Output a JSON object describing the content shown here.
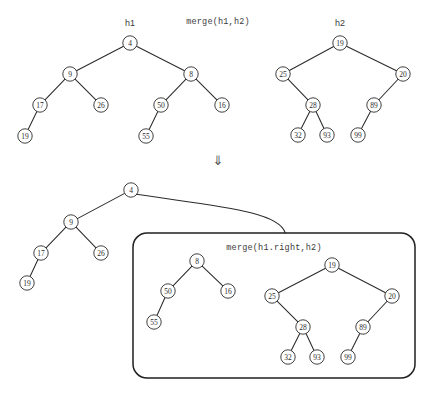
{
  "diagram": {
    "title_top_operation": "merge(h1,h2)",
    "title_box_operation": "merge(h1.right,h2)",
    "label_h1": "h1",
    "label_h2": "h2",
    "transition_arrow": "⇓",
    "colors": {
      "stroke": "#2b2b2b",
      "node_fill": "#ffffff",
      "box_stroke": "#1f1f1f",
      "text": "#3b3b3b",
      "background": "#ffffff"
    }
  },
  "top_h1_tree": {
    "name": "h1",
    "nodes": [
      {
        "id": "t1-4",
        "value": "4",
        "x": 130,
        "y": 43
      },
      {
        "id": "t1-9",
        "value": "9",
        "x": 70,
        "y": 74
      },
      {
        "id": "t1-8",
        "value": "8",
        "x": 191,
        "y": 74
      },
      {
        "id": "t1-17",
        "value": "17",
        "x": 40,
        "y": 105
      },
      {
        "id": "t1-26",
        "value": "26",
        "x": 101,
        "y": 105
      },
      {
        "id": "t1-50",
        "value": "50",
        "x": 161,
        "y": 105
      },
      {
        "id": "t1-16",
        "value": "16",
        "x": 222,
        "y": 105
      },
      {
        "id": "t1-19",
        "value": "19",
        "x": 25,
        "y": 136
      },
      {
        "id": "t1-55",
        "value": "55",
        "x": 146,
        "y": 136
      }
    ],
    "edges": [
      [
        "t1-4",
        "t1-9"
      ],
      [
        "t1-4",
        "t1-8"
      ],
      [
        "t1-9",
        "t1-17"
      ],
      [
        "t1-9",
        "t1-26"
      ],
      [
        "t1-8",
        "t1-50"
      ],
      [
        "t1-8",
        "t1-16"
      ],
      [
        "t1-17",
        "t1-19"
      ],
      [
        "t1-50",
        "t1-55"
      ]
    ]
  },
  "top_h2_tree": {
    "name": "h2",
    "nodes": [
      {
        "id": "t2-19",
        "value": "19",
        "x": 340,
        "y": 43
      },
      {
        "id": "t2-25",
        "value": "25",
        "x": 283,
        "y": 74
      },
      {
        "id": "t2-20",
        "value": "20",
        "x": 403,
        "y": 74
      },
      {
        "id": "t2-28",
        "value": "28",
        "x": 313,
        "y": 105
      },
      {
        "id": "t2-89",
        "value": "89",
        "x": 374,
        "y": 105
      },
      {
        "id": "t2-32",
        "value": "32",
        "x": 298,
        "y": 135
      },
      {
        "id": "t2-93",
        "value": "93",
        "x": 327,
        "y": 135
      },
      {
        "id": "t2-99",
        "value": "99",
        "x": 358,
        "y": 135
      }
    ],
    "edges": [
      [
        "t2-19",
        "t2-25"
      ],
      [
        "t2-19",
        "t2-20"
      ],
      [
        "t2-25",
        "t2-28"
      ],
      [
        "t2-20",
        "t2-89"
      ],
      [
        "t2-28",
        "t2-32"
      ],
      [
        "t2-28",
        "t2-93"
      ],
      [
        "t2-89",
        "t2-99"
      ]
    ]
  },
  "bottom_result_tree": {
    "name": "merged-root",
    "nodes": [
      {
        "id": "b-4",
        "value": "4",
        "x": 131,
        "y": 190
      },
      {
        "id": "b-9",
        "value": "9",
        "x": 71,
        "y": 222
      },
      {
        "id": "b-17",
        "value": "17",
        "x": 41,
        "y": 253
      },
      {
        "id": "b-26",
        "value": "26",
        "x": 101,
        "y": 253
      },
      {
        "id": "b-19",
        "value": "19",
        "x": 27,
        "y": 283
      }
    ],
    "edges": [
      [
        "b-4",
        "b-9"
      ],
      [
        "b-9",
        "b-17"
      ],
      [
        "b-9",
        "b-26"
      ],
      [
        "b-17",
        "b-19"
      ]
    ]
  },
  "merge_box": {
    "label": "merge(h1.right,h2)",
    "x": 133,
    "y": 233,
    "width": 282,
    "height": 145,
    "radius": 14,
    "left_subtree": {
      "nodes": [
        {
          "id": "m-8",
          "value": "8",
          "x": 197,
          "y": 261
        },
        {
          "id": "m-50",
          "value": "50",
          "x": 168,
          "y": 291
        },
        {
          "id": "m-16",
          "value": "16",
          "x": 228,
          "y": 291
        },
        {
          "id": "m-55",
          "value": "55",
          "x": 154,
          "y": 322
        }
      ],
      "edges": [
        [
          "m-8",
          "m-50"
        ],
        [
          "m-8",
          "m-16"
        ],
        [
          "m-50",
          "m-55"
        ]
      ]
    },
    "right_subtree": {
      "nodes": [
        {
          "id": "m-19",
          "value": "19",
          "x": 332,
          "y": 265
        },
        {
          "id": "m-25",
          "value": "25",
          "x": 272,
          "y": 296
        },
        {
          "id": "m-20",
          "value": "20",
          "x": 392,
          "y": 296
        },
        {
          "id": "m-28",
          "value": "28",
          "x": 303,
          "y": 327
        },
        {
          "id": "m-89",
          "value": "89",
          "x": 363,
          "y": 327
        },
        {
          "id": "m-32",
          "value": "32",
          "x": 288,
          "y": 357
        },
        {
          "id": "m-93",
          "value": "93",
          "x": 317,
          "y": 357
        },
        {
          "id": "m-99",
          "value": "99",
          "x": 348,
          "y": 357
        }
      ],
      "edges": [
        [
          "m-19",
          "m-25"
        ],
        [
          "m-19",
          "m-20"
        ],
        [
          "m-25",
          "m-28"
        ],
        [
          "m-20",
          "m-89"
        ],
        [
          "m-28",
          "m-32"
        ],
        [
          "m-28",
          "m-93"
        ],
        [
          "m-89",
          "m-99"
        ]
      ]
    }
  },
  "labels": {
    "h1_title": {
      "text": "h1",
      "x": 130,
      "y": 26
    },
    "h2_title": {
      "text": "h2",
      "x": 340,
      "y": 26
    },
    "top_op": {
      "text": "merge(h1,h2)",
      "x": 218,
      "y": 24
    },
    "box_op": {
      "text": "merge(h1.right,h2)",
      "x": 274,
      "y": 250
    },
    "arrow": {
      "text": "⇓",
      "x": 218,
      "y": 165
    }
  },
  "node_radius": 7.2
}
